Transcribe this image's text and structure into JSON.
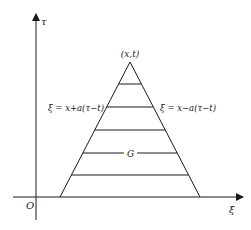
{
  "diagram": {
    "axes": {
      "vertical_label": "τ",
      "horizontal_label": "ξ",
      "origin_label": "O"
    },
    "apex_label": "(x,t)",
    "left_edge_label": "ξ = x+a(τ−t)",
    "right_edge_label": "ξ = x−a(τ−t)",
    "region_label": "G",
    "colors": {
      "stroke": "#1a1a1a",
      "background": "#ffffff"
    }
  }
}
